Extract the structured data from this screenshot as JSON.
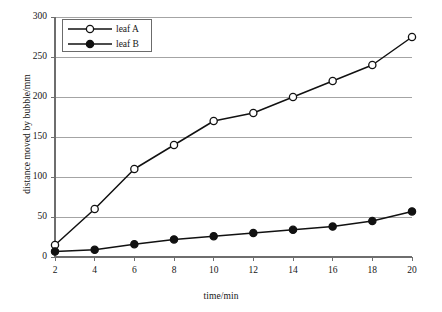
{
  "chart_data": {
    "type": "line",
    "title": "",
    "xlabel": "time/min",
    "ylabel": "distance moved by bubble/mm",
    "x": [
      2,
      4,
      6,
      8,
      10,
      12,
      14,
      16,
      18,
      20
    ],
    "xlim": [
      2,
      20
    ],
    "ylim": [
      0,
      300
    ],
    "xticks": [
      "2",
      "4",
      "6",
      "8",
      "10",
      "12",
      "14",
      "16",
      "18",
      "20"
    ],
    "yticks": [
      "0",
      "50",
      "100",
      "150",
      "200",
      "250",
      "300"
    ],
    "grid": "horizontal",
    "legend_position": "top-left",
    "series": [
      {
        "name": "leaf A",
        "marker": "open-circle",
        "values": [
          15,
          60,
          110,
          140,
          170,
          180,
          200,
          220,
          240,
          275
        ]
      },
      {
        "name": "leaf B",
        "marker": "filled-circle",
        "values": [
          7,
          9,
          16,
          22,
          26,
          30,
          34,
          38,
          45,
          57
        ]
      }
    ]
  },
  "legend": {
    "series_a_label": "leaf A",
    "series_b_label": "leaf B"
  },
  "colors": {
    "line": "#111111",
    "grid": "#9a9a9a",
    "axis": "#6e6e6e",
    "text": "#161616",
    "background": "#ffffff"
  }
}
